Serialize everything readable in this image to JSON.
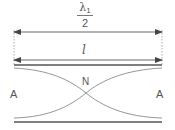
{
  "diagram": {
    "labels": {
      "wavelength_symbol": "λ",
      "wavelength_subscript": "1",
      "wavelength_denominator": "2",
      "length": "l",
      "node": "N",
      "antinode_left": "A",
      "antinode_right": "A"
    },
    "colors": {
      "line": "#555555",
      "curve": "#888888",
      "dashed": "#999999",
      "text": "#555555",
      "background": "#ffffff"
    }
  }
}
